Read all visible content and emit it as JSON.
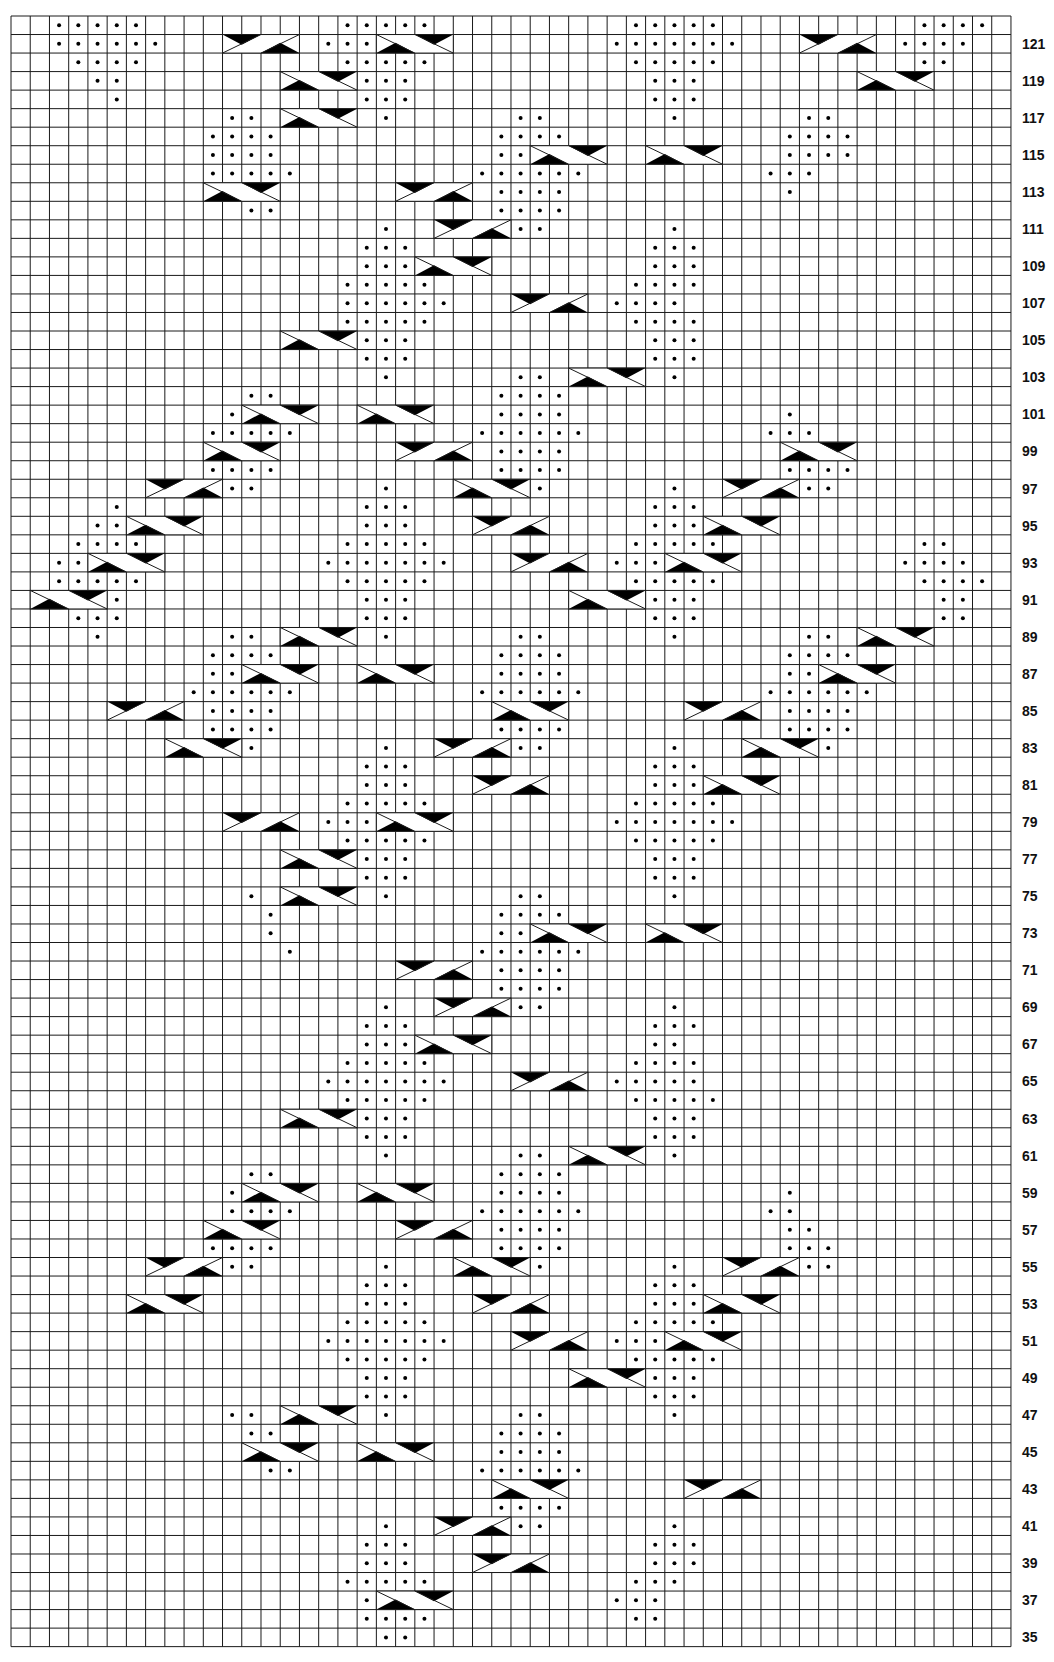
{
  "chart": {
    "columns": 52,
    "rows_from": 35,
    "rows_to": 122,
    "grid": {
      "left": 11,
      "top": 16,
      "cell_w": 19.23,
      "cell_h": 18.53
    },
    "colors": {
      "line": "#1a1a1a",
      "fill": "#000000",
      "background": "#ffffff"
    },
    "legend_symbols": [
      "knit (blank)",
      "purl (dot)",
      "right cable cross",
      "left cable cross"
    ],
    "row_labels": [
      121,
      119,
      117,
      115,
      113,
      111,
      109,
      107,
      105,
      103,
      101,
      99,
      97,
      95,
      93,
      91,
      89,
      87,
      85,
      83,
      81,
      79,
      77,
      75,
      73,
      71,
      69,
      67,
      65,
      63,
      61,
      59,
      57,
      55,
      53,
      51,
      49,
      47,
      45,
      43,
      41,
      39,
      37,
      35
    ],
    "motif": {
      "period_x": 15,
      "period_y": 14,
      "diamond_radius": 4,
      "cable_width": 4
    }
  }
}
